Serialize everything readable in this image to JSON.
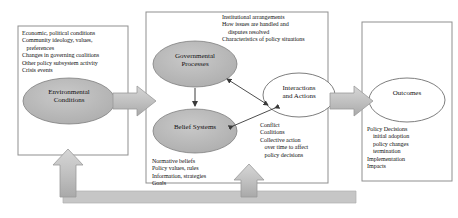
{
  "diagram": {
    "colors": {
      "ellipse_gray_fill": "#b8b8b8",
      "ellipse_white_fill": "#ffffff",
      "block_arrow_fill": "#bcbcbc",
      "feedback_bar_fill": "#c4c4c4",
      "box_border": "#8a8a8a",
      "text": "#111111"
    },
    "left_box": {
      "name": "external-parameters-box",
      "lines": [
        "Economic, political conditions",
        "Community ideology, values,",
        "   preferences",
        "Changes in governing coalitions",
        "Other policy subsystem activity",
        "Crisis events"
      ],
      "node_label": "Environmental\nConditions"
    },
    "center_box": {
      "name": "policy-subsystem-box",
      "institutional_lines": [
        "Institutional arrangements",
        "How issues are handled and",
        "    disputes resolved",
        "Characteristics of policy situations"
      ],
      "governmental_label": "Governmental\nProcesses",
      "belief_label": "Belief Systems",
      "belief_lines": [
        "Normative beliefs",
        "Policy values, rules",
        "Information, strategies",
        "Goals"
      ],
      "interactions_label": "Interactions\nand Actions",
      "interactions_lines": [
        "Conflict",
        "Coalitions",
        "Collective action",
        "   over time to affect",
        "   policy decisions"
      ]
    },
    "right_box": {
      "name": "outcomes-box",
      "node_label": "Outcomes",
      "lines": [
        "Policy Decisions",
        "    initial adoption",
        "    policy changes",
        "    termination",
        "Implementation",
        "Impacts"
      ]
    },
    "connectors": {
      "left_to_center": "block-arrow-right",
      "center_to_right": "block-arrow-right",
      "feedback_to_environment": "block-arrow-up",
      "feedback_to_subsystem": "block-arrow-up",
      "gov_to_belief": "arrow-down",
      "gov_to_interactions": "arrow-double-diagonal",
      "belief_to_interactions": "arrow-double-diagonal"
    }
  }
}
